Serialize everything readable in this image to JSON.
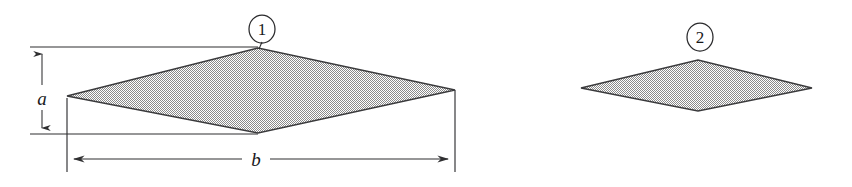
{
  "figure": {
    "background_color": "#ffffff",
    "ink_color": "#2f2f31",
    "fill_color": "#b9b9b9",
    "outline_color": "#3a3a3c",
    "width": 852,
    "height": 187
  },
  "plates": [
    {
      "id": "plate-1",
      "callout": "1",
      "callout_center": {
        "x": 262,
        "y": 29
      },
      "callout_radius": 13,
      "leader": {
        "x1": 262,
        "y1": 42,
        "x2": 259,
        "y2": 48
      },
      "vertices": {
        "left": {
          "x": 67,
          "y": 96
        },
        "top": {
          "x": 258,
          "y": 48
        },
        "right": {
          "x": 455,
          "y": 90
        },
        "bottom": {
          "x": 258,
          "y": 133
        }
      }
    },
    {
      "id": "plate-2",
      "callout": "2",
      "callout_center": {
        "x": 700,
        "y": 37
      },
      "callout_radius": 13,
      "leader": {
        "x1": 700,
        "y1": 50,
        "x2": 698,
        "y2": 60
      },
      "vertices": {
        "left": {
          "x": 581,
          "y": 88
        },
        "top": {
          "x": 698,
          "y": 60
        },
        "right": {
          "x": 812,
          "y": 88
        },
        "bottom": {
          "x": 698,
          "y": 111
        }
      }
    }
  ],
  "dimensions": [
    {
      "id": "dimension-a",
      "label": "a",
      "orientation": "vertical",
      "label_position": {
        "x": 42,
        "y": 99
      },
      "line": {
        "x1": 42,
        "y1": 47,
        "x2": 42,
        "y2": 134
      },
      "extension_lines": [
        {
          "x1": 30,
          "y1": 47,
          "x2": 258,
          "y2": 47
        },
        {
          "x1": 30,
          "y1": 134,
          "x2": 258,
          "y2": 134
        }
      ],
      "arrow_ends": [
        "start",
        "end"
      ]
    },
    {
      "id": "dimension-b",
      "label": "b",
      "orientation": "horizontal",
      "label_position": {
        "x": 256,
        "y": 163
      },
      "line": {
        "x1": 67,
        "y1": 159,
        "x2": 455,
        "y2": 159
      },
      "extension_lines": [
        {
          "x1": 67,
          "y1": 98,
          "x2": 67,
          "y2": 172
        },
        {
          "x1": 455,
          "y1": 90,
          "x2": 455,
          "y2": 172
        }
      ],
      "arrow_ends": [
        "start",
        "end"
      ]
    }
  ]
}
